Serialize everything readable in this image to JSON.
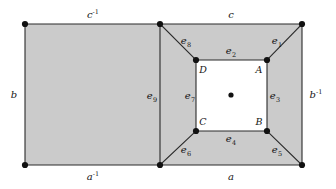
{
  "figure": {
    "kind": "cw-complex-polygon-diagram",
    "colors": {
      "region_fill": "#cbcbcb",
      "inner_fill": "#ffffff",
      "stroke": "#2a2a2a",
      "vertex": "#111111",
      "label": "#151515",
      "background": "#ffffff"
    },
    "geometry": {
      "outer": {
        "left": 25,
        "top": 24,
        "right": 302,
        "bottom": 165
      },
      "divider_x": 160,
      "inner": {
        "left": 196,
        "top": 60,
        "right": 267,
        "bottom": 131
      }
    }
  },
  "outer_edges": [
    {
      "id": "c-inverse",
      "label": "c",
      "exponent": "-1",
      "position": "top-left",
      "lx": 93,
      "ly": 15
    },
    {
      "id": "c",
      "label": "c",
      "exponent": "",
      "position": "top-right",
      "lx": 231,
      "ly": 15
    },
    {
      "id": "b",
      "label": "b",
      "exponent": "",
      "position": "left",
      "lx": 14,
      "ly": 95
    },
    {
      "id": "b-inverse",
      "label": "b",
      "exponent": "-1",
      "position": "right",
      "lx": 316,
      "ly": 95
    },
    {
      "id": "a-inverse",
      "label": "a",
      "exponent": "-1",
      "position": "bottom-left",
      "lx": 93,
      "ly": 177
    },
    {
      "id": "a",
      "label": "a",
      "exponent": "",
      "position": "bottom-right",
      "lx": 231,
      "ly": 177
    }
  ],
  "inner_edges": [
    {
      "id": "e1",
      "label": "e",
      "index": "1",
      "role": "diagonal-top-right",
      "lx": 277,
      "ly": 41
    },
    {
      "id": "e2",
      "label": "e",
      "index": "2",
      "role": "inner-top",
      "lx": 231,
      "ly": 51
    },
    {
      "id": "e3",
      "label": "e",
      "index": "3",
      "role": "inner-right",
      "lx": 275,
      "ly": 96
    },
    {
      "id": "e4",
      "label": "e",
      "index": "4",
      "role": "inner-bottom",
      "lx": 231,
      "ly": 139
    },
    {
      "id": "e5",
      "label": "e",
      "index": "5",
      "role": "diagonal-bottom-right",
      "lx": 277,
      "ly": 150
    },
    {
      "id": "e6",
      "label": "e",
      "index": "6",
      "role": "diagonal-bottom-left",
      "lx": 186,
      "ly": 150
    },
    {
      "id": "e7",
      "label": "e",
      "index": "7",
      "role": "inner-left",
      "lx": 190,
      "ly": 96
    },
    {
      "id": "e8",
      "label": "e",
      "index": "8",
      "role": "diagonal-top-left",
      "lx": 186,
      "ly": 41
    },
    {
      "id": "e9",
      "label": "e",
      "index": "9",
      "role": "vertical-divider",
      "lx": 152,
      "ly": 96
    }
  ],
  "vertex_labels": [
    {
      "id": "A",
      "label": "A",
      "corner": "inner-top-right",
      "lx": 259,
      "ly": 70
    },
    {
      "id": "B",
      "label": "B",
      "corner": "inner-bottom-right",
      "lx": 259,
      "ly": 122
    },
    {
      "id": "C",
      "label": "C",
      "corner": "inner-bottom-left",
      "lx": 203,
      "ly": 122
    },
    {
      "id": "D",
      "label": "D",
      "corner": "inner-top-left",
      "lx": 203,
      "ly": 70
    }
  ],
  "vertices": [
    {
      "id": "outer-top-left",
      "x": 25,
      "y": 24
    },
    {
      "id": "outer-top-mid",
      "x": 160,
      "y": 24
    },
    {
      "id": "outer-top-right",
      "x": 302,
      "y": 24
    },
    {
      "id": "outer-bottom-left",
      "x": 25,
      "y": 165
    },
    {
      "id": "outer-bottom-mid",
      "x": 160,
      "y": 165
    },
    {
      "id": "outer-bottom-right",
      "x": 302,
      "y": 165
    },
    {
      "id": "inner-D",
      "x": 196,
      "y": 60
    },
    {
      "id": "inner-A",
      "x": 267,
      "y": 60
    },
    {
      "id": "inner-C",
      "x": 196,
      "y": 131
    },
    {
      "id": "inner-B",
      "x": 267,
      "y": 131
    },
    {
      "id": "center-dot",
      "x": 231,
      "y": 95
    }
  ]
}
